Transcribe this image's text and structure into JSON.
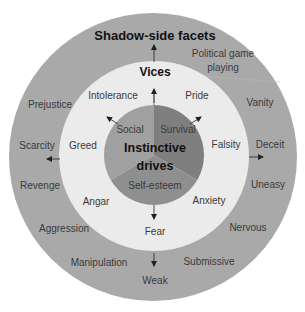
{
  "diagram": {
    "title_outer": "Shadow-side facets",
    "title_middle": "Vices",
    "center_title_line1": "Instinctive",
    "center_title_line2": "drives",
    "colors": {
      "outer_ring": "#a9a9a9",
      "middle_ring": "#ebebeb",
      "survival": "#7f7f7f",
      "self_esteem": "#8f8f8f",
      "social": "#a0a0a0",
      "text": "#3a3a3a",
      "title": "#111111"
    },
    "drives": [
      {
        "label": "Survival"
      },
      {
        "label": "Self-esteem"
      },
      {
        "label": "Social"
      }
    ],
    "vices": [
      {
        "label": "Intolerance"
      },
      {
        "label": "Pride"
      },
      {
        "label": "Greed"
      },
      {
        "label": "Falsity"
      },
      {
        "label": "Angar"
      },
      {
        "label": "Anxiety"
      },
      {
        "label": "Fear"
      }
    ],
    "facets": [
      {
        "label": "Political game"
      },
      {
        "label": "playing"
      },
      {
        "label": "Prejustice"
      },
      {
        "label": "Vanity"
      },
      {
        "label": "Scarcity"
      },
      {
        "label": "Deceit"
      },
      {
        "label": "Revenge"
      },
      {
        "label": "Uneasy"
      },
      {
        "label": "Aggression"
      },
      {
        "label": "Nervous"
      },
      {
        "label": "Manipulation"
      },
      {
        "label": "Submissive"
      },
      {
        "label": "Weak"
      }
    ]
  }
}
